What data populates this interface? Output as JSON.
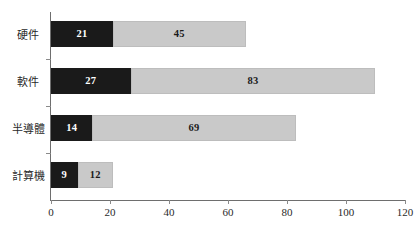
{
  "chart_data": {
    "type": "bar",
    "orientation": "horizontal",
    "stacked": true,
    "title": "",
    "subtitle": "",
    "xlabel": "",
    "ylabel": "",
    "xlim": [
      0,
      120
    ],
    "ylim": null,
    "grid": false,
    "legend": null,
    "xticks": [
      0,
      20,
      40,
      60,
      80,
      100,
      120
    ],
    "xtick_labels": [
      "0",
      "20",
      "40",
      "60",
      "80",
      "100",
      "120"
    ],
    "categories": [
      "計算機",
      "半導體",
      "軟件",
      "硬件"
    ],
    "categories_top_to_bottom": [
      "硬件",
      "軟件",
      "半導體",
      "計算機"
    ],
    "series": [
      {
        "name": "series-1",
        "color": "#1a1a1a",
        "values_top_to_bottom": [
          21,
          27,
          14,
          9
        ]
      },
      {
        "name": "series-2",
        "color": "#c9c9c9",
        "values_top_to_bottom": [
          45,
          83,
          69,
          12
        ]
      }
    ],
    "rows": [
      {
        "category": "硬件",
        "dark_value": 21,
        "light_value": 45,
        "total": 66,
        "dark_label": "21",
        "light_label": "45"
      },
      {
        "category": "軟件",
        "dark_value": 27,
        "light_value": 83,
        "total": 110,
        "dark_label": "27",
        "light_label": "83"
      },
      {
        "category": "半導體",
        "dark_value": 14,
        "light_value": 69,
        "total": 83,
        "dark_label": "14",
        "light_label": "69"
      },
      {
        "category": "計算機",
        "dark_value": 9,
        "light_value": 12,
        "total": 21,
        "dark_label": "9",
        "light_label": "12"
      }
    ],
    "colors": {
      "dark_segment": "#1a1a1a",
      "light_segment": "#c9c9c9",
      "axis": "#6e6e6e",
      "text": "#2a2a2a",
      "background": "#ffffff"
    }
  }
}
